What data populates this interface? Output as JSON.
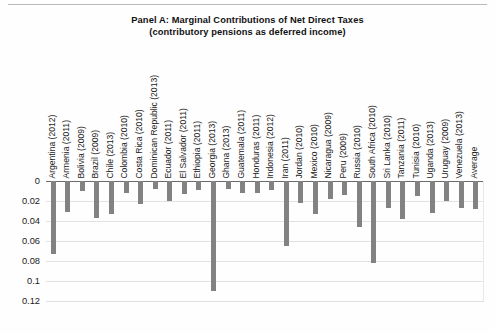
{
  "figure": {
    "title_line1": "Panel A: Marginal Contributions of Net Direct Taxes",
    "title_line2": "(contributory pensions as deferred income)"
  },
  "chart_data": {
    "type": "bar",
    "title": "Panel A: Marginal Contributions of Net Direct Taxes (contributory pensions as deferred income)",
    "xlabel": "",
    "ylabel": "",
    "ylim": [
      0,
      0.12
    ],
    "y_axis_inverted": true,
    "grid": true,
    "legend": "none",
    "bar_color": "#828282",
    "yticks": [
      "0",
      "0.02",
      "0.04",
      "0.06",
      "0.08",
      "0.1",
      "0.12"
    ],
    "ytick_values": [
      0,
      0.02,
      0.04,
      0.06,
      0.08,
      0.1,
      0.12
    ],
    "categories": [
      "Argentina (2012)",
      "Armenia (2011)",
      "Bolivia (2009)",
      "Brazil (2009)",
      "Chile (2013)",
      "Colombia (2010)",
      "Costa Rica (2010)",
      "Dominican Republic (2013)",
      "Ecuador (2011)",
      "El Salvador (2011)",
      "Ethiopia (2011)",
      "Georgia (2013)",
      "Ghana (2013)",
      "Guatemala (2011)",
      "Honduras (2011)",
      "Indonesia (2012)",
      "Iran (2011)",
      "Jordan (2010)",
      "Mexico (2010)",
      "Nicaragua (2009)",
      "Peru (2009)",
      "Russia (2010)",
      "South Africa (2010)",
      "Sri Lanka (2010)",
      "Tanzania (2011)",
      "Tunisia (2010)",
      "Uganda (2013)",
      "Uruguay (2009)",
      "Venezuela (2013)",
      "Average"
    ],
    "values": [
      0.073,
      0.031,
      0.01,
      0.037,
      0.033,
      0.012,
      0.023,
      0.008,
      0.02,
      0.013,
      0.009,
      0.11,
      0.008,
      0.012,
      0.012,
      0.009,
      0.065,
      0.022,
      0.033,
      0.018,
      0.014,
      0.046,
      0.082,
      0.027,
      0.038,
      0.015,
      0.032,
      0.02,
      0.027,
      0.028
    ]
  }
}
